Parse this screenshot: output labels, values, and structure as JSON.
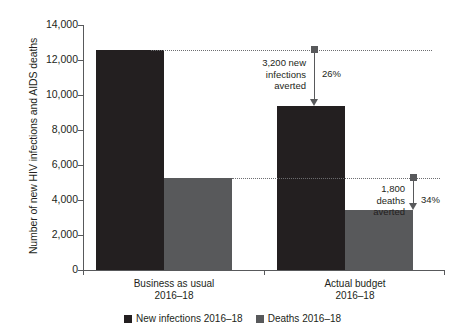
{
  "chart_data": {
    "type": "bar",
    "title": "",
    "xlabel": "",
    "ylabel": "Number of new HIV infections and AIDS deaths",
    "ylim": [
      0,
      14000
    ],
    "yticks": [
      "0",
      "2,000",
      "4,000",
      "6,000",
      "8,000",
      "10,000",
      "12,000",
      "14,000"
    ],
    "ytick_values": [
      0,
      2000,
      4000,
      6000,
      8000,
      10000,
      12000,
      14000
    ],
    "grid": false,
    "legend_position": "bottom-center",
    "categories": [
      "Business as usual\n2016–18",
      "Actual budget\n2016–18"
    ],
    "category_labels": [
      {
        "line1": "Business as usual",
        "line2": "2016–18"
      },
      {
        "line1": "Actual budget",
        "line2": "2016–18"
      }
    ],
    "series": [
      {
        "name": "New infections 2016–18",
        "color": "#231f20",
        "values": [
          12600,
          9400
        ]
      },
      {
        "name": "Deaths 2016–18",
        "color": "#58595b",
        "values": [
          5250,
          3450
        ]
      }
    ],
    "annotations": [
      {
        "id": "infections-averted",
        "text_line1": "3,200 new",
        "text_line2": "infections",
        "text_line3": "averted",
        "percent": "26%",
        "from_value": 12600,
        "to_value": 9400
      },
      {
        "id": "deaths-averted",
        "text_line1": "1,800",
        "text_line2": "deaths",
        "text_line3": "averted",
        "percent": "34%",
        "from_value": 5250,
        "to_value": 3450
      }
    ]
  },
  "legend": {
    "items": [
      {
        "label": "New infections 2016–18",
        "color": "#231f20"
      },
      {
        "label": "Deaths 2016–18",
        "color": "#58595b"
      }
    ]
  }
}
